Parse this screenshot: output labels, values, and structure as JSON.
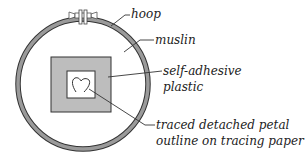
{
  "labels": {
    "hoop": "hoop",
    "muslin": "muslin",
    "plastic_line1": "self-adhesive",
    "plastic_line2": "plastic",
    "tracing_line1": "traced detached petal",
    "tracing_line2": "outline on tracing paper"
  },
  "colors": {
    "hoop": "#8a8a8a",
    "plastic": "#bdbdbd",
    "line": "#333333"
  }
}
